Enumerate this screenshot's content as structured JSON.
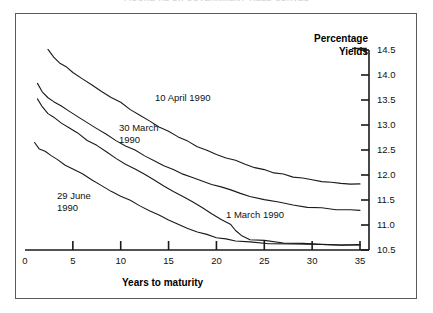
{
  "title": "FIGURE 7.2  UK GOVERNMENT YIELD CURVES",
  "frame": {
    "border_color": "#5a5a5a"
  },
  "chart_data": {
    "type": "line",
    "title": "",
    "xlabel": "Years to maturity",
    "ylabel": "Percentage Yields",
    "xlim": [
      0,
      36.5
    ],
    "ylim": [
      10.5,
      14.75
    ],
    "grid": false,
    "legend": "inline-annotations",
    "line_color": "#1a1a1a",
    "x_ticks": [
      0,
      5,
      10,
      15,
      20,
      25,
      30,
      35
    ],
    "x_tick_labels": [
      "0",
      "5",
      "10",
      "15",
      "20",
      "25",
      "30",
      "35"
    ],
    "y_ticks": [
      10.5,
      11.0,
      11.5,
      12.0,
      12.5,
      13.0,
      13.5,
      14.0,
      14.5
    ],
    "y_tick_labels": [
      "10.5",
      "11.0",
      "11.5",
      "12.0",
      "12.5",
      "13.0",
      "13.5",
      "14.0",
      "14.5"
    ],
    "series": [
      {
        "name": "10 April 1990",
        "label": "10 April 1990",
        "points": [
          [
            2.4,
            14.52
          ],
          [
            3.0,
            14.36
          ],
          [
            3.6,
            14.24
          ],
          [
            4.3,
            14.16
          ],
          [
            5.0,
            14.06
          ],
          [
            6.0,
            13.93
          ],
          [
            7.0,
            13.8
          ],
          [
            8.0,
            13.67
          ],
          [
            9.0,
            13.55
          ],
          [
            10.0,
            13.44
          ],
          [
            11.0,
            13.31
          ],
          [
            12.0,
            13.2
          ],
          [
            13.0,
            13.08
          ],
          [
            14.0,
            12.97
          ],
          [
            15.0,
            12.87
          ],
          [
            16.0,
            12.76
          ],
          [
            17.0,
            12.67
          ],
          [
            18.0,
            12.58
          ],
          [
            19.0,
            12.5
          ],
          [
            20.0,
            12.42
          ],
          [
            21.0,
            12.35
          ],
          [
            22.0,
            12.28
          ],
          [
            23.0,
            12.22
          ],
          [
            24.0,
            12.16
          ],
          [
            25.0,
            12.1
          ],
          [
            26.0,
            12.05
          ],
          [
            27.0,
            12.01
          ],
          [
            28.0,
            11.97
          ],
          [
            29.0,
            11.93
          ],
          [
            30.0,
            11.9
          ],
          [
            31.0,
            11.87
          ],
          [
            32.0,
            11.85
          ],
          [
            33.0,
            11.83
          ],
          [
            34.0,
            11.82
          ],
          [
            35.0,
            11.81
          ]
        ]
      },
      {
        "name": "30 March 1990",
        "label": "30 March\n1990",
        "points": [
          [
            1.3,
            13.82
          ],
          [
            1.8,
            13.66
          ],
          [
            2.4,
            13.54
          ],
          [
            3.0,
            13.48
          ],
          [
            3.8,
            13.38
          ],
          [
            4.6,
            13.28
          ],
          [
            5.5,
            13.17
          ],
          [
            6.5,
            13.05
          ],
          [
            7.5,
            12.93
          ],
          [
            8.5,
            12.81
          ],
          [
            9.5,
            12.7
          ],
          [
            10.5,
            12.59
          ],
          [
            11.5,
            12.49
          ],
          [
            12.5,
            12.39
          ],
          [
            13.5,
            12.29
          ],
          [
            14.5,
            12.2
          ],
          [
            15.5,
            12.11
          ],
          [
            16.5,
            12.03
          ],
          [
            17.5,
            11.95
          ],
          [
            18.5,
            11.88
          ],
          [
            19.5,
            11.81
          ],
          [
            20.5,
            11.75
          ],
          [
            21.5,
            11.69
          ],
          [
            22.5,
            11.63
          ],
          [
            23.5,
            11.58
          ],
          [
            25.0,
            11.51
          ],
          [
            26.5,
            11.45
          ],
          [
            28.0,
            11.4
          ],
          [
            29.5,
            11.36
          ],
          [
            31.0,
            11.33
          ],
          [
            32.5,
            11.31
          ],
          [
            34.0,
            11.29
          ],
          [
            35.0,
            11.29
          ]
        ]
      },
      {
        "name": "1 March 1990",
        "label": "1 March 1990",
        "points": [
          [
            1.3,
            13.52
          ],
          [
            1.8,
            13.36
          ],
          [
            2.4,
            13.24
          ],
          [
            3.0,
            13.16
          ],
          [
            3.8,
            13.05
          ],
          [
            4.6,
            12.95
          ],
          [
            5.5,
            12.83
          ],
          [
            6.5,
            12.7
          ],
          [
            7.5,
            12.58
          ],
          [
            8.5,
            12.46
          ],
          [
            9.5,
            12.34
          ],
          [
            10.5,
            12.22
          ],
          [
            11.5,
            12.11
          ],
          [
            12.5,
            12.0
          ],
          [
            13.5,
            11.89
          ],
          [
            14.5,
            11.78
          ],
          [
            15.5,
            11.67
          ],
          [
            16.5,
            11.56
          ],
          [
            17.5,
            11.45
          ],
          [
            18.5,
            11.34
          ],
          [
            19.5,
            11.23
          ],
          [
            20.5,
            11.12
          ],
          [
            21.5,
            11.0
          ],
          [
            22.0,
            10.88
          ],
          [
            22.6,
            10.78
          ],
          [
            23.5,
            10.72
          ],
          [
            25.0,
            10.68
          ],
          [
            27.0,
            10.65
          ],
          [
            29.0,
            10.63
          ],
          [
            31.0,
            10.62
          ],
          [
            33.0,
            10.61
          ],
          [
            35.0,
            10.6
          ]
        ]
      },
      {
        "name": "29 June 1990",
        "label": "29 June\n1990",
        "points": [
          [
            1.0,
            12.66
          ],
          [
            1.5,
            12.52
          ],
          [
            2.1,
            12.46
          ],
          [
            2.7,
            12.38
          ],
          [
            3.4,
            12.3
          ],
          [
            4.2,
            12.21
          ],
          [
            5.0,
            12.12
          ],
          [
            6.0,
            12.01
          ],
          [
            7.0,
            11.9
          ],
          [
            8.0,
            11.79
          ],
          [
            9.0,
            11.68
          ],
          [
            10.0,
            11.58
          ],
          [
            11.0,
            11.48
          ],
          [
            12.0,
            11.38
          ],
          [
            13.0,
            11.28
          ],
          [
            14.0,
            11.19
          ],
          [
            15.0,
            11.1
          ],
          [
            16.0,
            11.01
          ],
          [
            17.0,
            10.94
          ],
          [
            18.0,
            10.87
          ],
          [
            19.0,
            10.81
          ],
          [
            20.0,
            10.76
          ],
          [
            21.0,
            10.72
          ],
          [
            22.0,
            10.69
          ],
          [
            23.5,
            10.66
          ],
          [
            25.5,
            10.64
          ],
          [
            28.0,
            10.62
          ],
          [
            31.0,
            10.61
          ],
          [
            33.0,
            10.6
          ],
          [
            35.0,
            10.6
          ]
        ]
      }
    ],
    "annotations": [
      {
        "name": "label-10-april-1990",
        "text": "10 April 1990"
      },
      {
        "name": "label-30-march-1990",
        "line1": "30 March",
        "line2": "1990"
      },
      {
        "name": "label-29-june-1990",
        "line1": "29 June",
        "line2": "1990"
      },
      {
        "name": "label-1-march-1990",
        "text": "1 March 1990"
      }
    ]
  }
}
